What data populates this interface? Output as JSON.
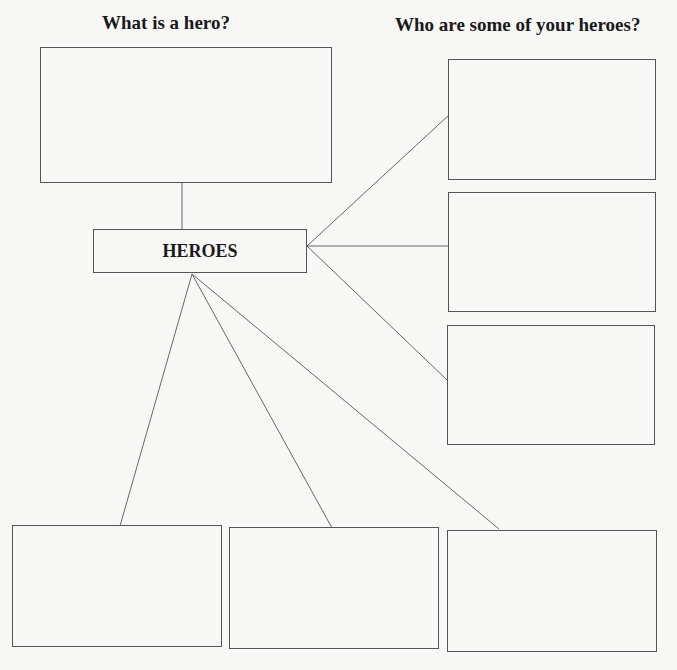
{
  "diagram": {
    "type": "concept-map",
    "headings": {
      "left": "What is a hero?",
      "right": "Who are some of your heroes?"
    },
    "center_node": {
      "label": "HEROES"
    },
    "definition_box": {
      "label": ""
    },
    "hero_boxes_right": [
      {
        "label": ""
      },
      {
        "label": ""
      },
      {
        "label": ""
      }
    ],
    "hero_boxes_bottom": [
      {
        "label": ""
      },
      {
        "label": ""
      },
      {
        "label": ""
      }
    ],
    "colors": {
      "line": "#666666",
      "border": "#555555",
      "text": "#1a1a1a",
      "background": "#f7f7f6"
    }
  }
}
